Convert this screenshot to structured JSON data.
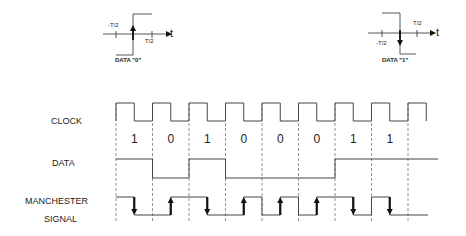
{
  "legend": {
    "data0": {
      "caption": "DATA \"0\"",
      "neg_label": "-T/2",
      "pos_label": "T/2",
      "axis_label": "t",
      "transition": "rising"
    },
    "data1": {
      "caption": "DATA \"1\"",
      "neg_label": "-T/2",
      "pos_label": "T/2",
      "axis_label": "t",
      "transition": "falling"
    }
  },
  "rows": {
    "clock": "CLOCK",
    "data": "DATA",
    "manchester_line1": "MANCHESTER",
    "manchester_line2": "SIGNAL"
  },
  "bits": [
    "1",
    "0",
    "1",
    "0",
    "0",
    "0",
    "1",
    "1"
  ],
  "encoding": {
    "one": "high-to-low transition at mid-bit",
    "zero": "low-to-high transition at mid-bit"
  },
  "colors": {
    "line": "#444444",
    "arrow": "#111111",
    "dash": "#777777"
  }
}
